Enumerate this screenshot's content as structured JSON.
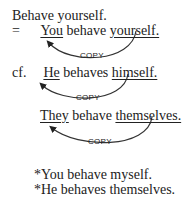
{
  "example1": {
    "imperative": "Behave yourself.",
    "equals": "=",
    "subject": "You",
    "verb": " behave ",
    "reflexive": "yourself.",
    "arrow_label": "COPY"
  },
  "example2": {
    "prefix": "cf.",
    "subject": "He",
    "verb": " behaves ",
    "reflexive": "himself.",
    "arrow_label": "COPY"
  },
  "example3": {
    "subject": "They",
    "verb": " behave ",
    "reflexive": "themselves.",
    "arrow_label": "COPY"
  },
  "ungrammatical": [
    "*You behave myself.",
    "*He behaves themselves."
  ]
}
